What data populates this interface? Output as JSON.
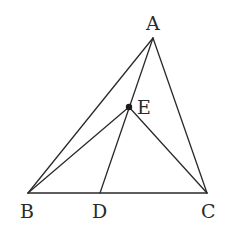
{
  "diagram": {
    "type": "geometry-triangle",
    "points": {
      "A": {
        "x": 153,
        "y": 38,
        "label": "A",
        "label_x": 146,
        "label_y": 30
      },
      "B": {
        "x": 28,
        "y": 193,
        "label": "B",
        "label_x": 20,
        "label_y": 218
      },
      "C": {
        "x": 207,
        "y": 193,
        "label": "C",
        "label_x": 201,
        "label_y": 218
      },
      "D": {
        "x": 100,
        "y": 193,
        "label": "D",
        "label_x": 92,
        "label_y": 218
      },
      "E": {
        "x": 129,
        "y": 107,
        "label": "E",
        "label_x": 137,
        "label_y": 114
      }
    },
    "segments": [
      {
        "from": "A",
        "to": "B"
      },
      {
        "from": "A",
        "to": "C"
      },
      {
        "from": "B",
        "to": "C"
      },
      {
        "from": "A",
        "to": "D"
      },
      {
        "from": "B",
        "to": "E"
      },
      {
        "from": "C",
        "to": "E"
      }
    ],
    "marked_points": [
      "E"
    ],
    "labels": {
      "A": "A",
      "B": "B",
      "C": "C",
      "D": "D",
      "E": "E"
    },
    "colors": {
      "line": "#2a2a2a",
      "point": "#1a1a1a",
      "background": "#ffffff"
    }
  }
}
